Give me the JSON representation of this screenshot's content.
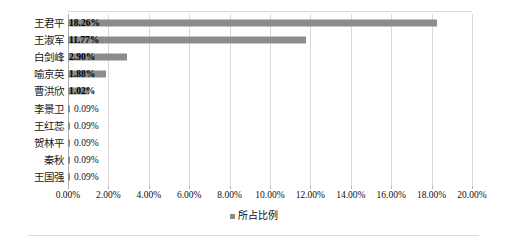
{
  "chart_data": {
    "type": "bar",
    "orientation": "horizontal",
    "title": "",
    "subtitle": "",
    "xlabel": "",
    "ylabel": "",
    "xlim": [
      0,
      20
    ],
    "xtick_labels": [
      "0.00%",
      "2.00%",
      "4.00%",
      "6.00%",
      "8.00%",
      "10.00%",
      "12.00%",
      "14.00%",
      "16.00%",
      "18.00%",
      "20.00%"
    ],
    "xtick_values": [
      0,
      2,
      4,
      6,
      8,
      10,
      12,
      14,
      16,
      18,
      20
    ],
    "grid": "vertical",
    "legend_position": "bottom-center",
    "categories": [
      "王君平",
      "王淑军",
      "白剑峰",
      "喻京英",
      "曹洪欣",
      "李景卫",
      "王红蕊",
      "贺林平",
      "秦秋",
      "王国强"
    ],
    "values": [
      18.26,
      11.77,
      2.9,
      1.88,
      1.02,
      0.09,
      0.09,
      0.09,
      0.09,
      0.09
    ],
    "data_labels": [
      "18.26%",
      "11.77%",
      "2.90%",
      "1.88%",
      "1.02%",
      "0.09%",
      "0.09%",
      "0.09%",
      "0.09%",
      "0.09%"
    ],
    "series": [
      {
        "name": "所占比例",
        "values": [
          18.26,
          11.77,
          2.9,
          1.88,
          1.02,
          0.09,
          0.09,
          0.09,
          0.09,
          0.09
        ],
        "color": "#8c8c8c"
      }
    ]
  },
  "legend": {
    "entries": [
      {
        "label": "所占比例",
        "color": "#8c8c8c",
        "marker": "square-marker"
      }
    ]
  },
  "colors": {
    "bar": "#8c8c8c",
    "gridline": "#d9d9d9",
    "axis": "#b0b0b0",
    "text": "#0f0f0f",
    "background": "#ffffff"
  }
}
